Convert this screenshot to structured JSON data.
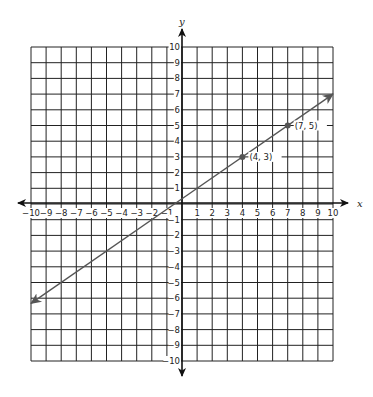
{
  "chart_data": {
    "type": "line",
    "title": "",
    "xlabel": "x",
    "ylabel": "y",
    "xlim": [
      -10,
      10
    ],
    "ylim": [
      -10,
      10
    ],
    "grid": true,
    "x_ticks": [
      -10,
      -9,
      -8,
      -7,
      -6,
      -5,
      -4,
      -3,
      -2,
      -1,
      1,
      2,
      3,
      4,
      5,
      6,
      7,
      8,
      9,
      10
    ],
    "y_ticks": [
      10,
      9,
      8,
      7,
      6,
      5,
      4,
      3,
      2,
      1,
      -1,
      -2,
      -3,
      -4,
      -5,
      -6,
      -7,
      -8,
      -9,
      -10
    ],
    "series": [
      {
        "name": "line",
        "equation": "y = 2/3 x + 1/3",
        "x": [
          -10,
          10
        ],
        "y": [
          -6.33,
          7
        ],
        "arrows_both_ends": true,
        "color": "#555555"
      }
    ],
    "points": [
      {
        "x": 4,
        "y": 3,
        "label": "(4, 3)"
      },
      {
        "x": 7,
        "y": 5,
        "label": "(7, 5)"
      }
    ]
  },
  "colors": {
    "grid": "#222222",
    "line": "#555555",
    "axis": "#111111"
  }
}
